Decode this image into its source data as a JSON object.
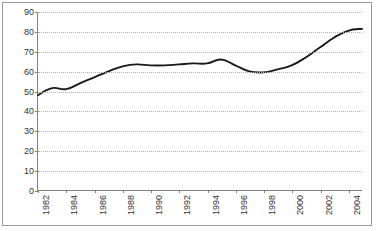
{
  "chart_data": {
    "type": "line",
    "title": "",
    "subtitle": "",
    "xlabel": "",
    "ylabel": "",
    "grid": true,
    "legend": false,
    "legend_position": "none",
    "line_color": "#1a1a1a",
    "grid_color": "#b0b0b0",
    "axis_color": "#808080",
    "xlim": [
      1982,
      2005
    ],
    "ylim": [
      0,
      90
    ],
    "ytick_step": 10,
    "ytick_labels": [
      "0",
      "10",
      "20",
      "30",
      "40",
      "50",
      "60",
      "70",
      "80",
      "90"
    ],
    "ytick_values": [
      0,
      10,
      20,
      30,
      40,
      50,
      60,
      70,
      80,
      90
    ],
    "xtick_labels": [
      "1982",
      "1984",
      "1986",
      "1988",
      "1990",
      "1992",
      "1994",
      "1996",
      "1998",
      "2000",
      "2002",
      "2004"
    ],
    "xtick_values": [
      1982,
      1984,
      1986,
      1988,
      1990,
      1992,
      1994,
      1996,
      1998,
      2000,
      2002,
      2004
    ],
    "xtick_rotation": -90,
    "x": [
      1982,
      1983,
      1984,
      1985,
      1986,
      1987,
      1988,
      1989,
      1990,
      1991,
      1992,
      1993,
      1994,
      1995,
      1996,
      1997,
      1998,
      1999,
      2000,
      2001,
      2002,
      2003,
      2004,
      2005
    ],
    "values": [
      48,
      51.5,
      51,
      54,
      57,
      60,
      62.5,
      63.5,
      63,
      63,
      63.5,
      64,
      64,
      66,
      63,
      60,
      59.5,
      61,
      63,
      67,
      72,
      77,
      80.5,
      81.5
    ],
    "series": [
      {
        "name": "series-1",
        "color": "#1a1a1a",
        "values": [
          48,
          51.5,
          51,
          54,
          57,
          60,
          62.5,
          63.5,
          63,
          63,
          63.5,
          64,
          64,
          66,
          63,
          60,
          59.5,
          61,
          63,
          67,
          72,
          77,
          80.5,
          81.5
        ]
      }
    ]
  }
}
